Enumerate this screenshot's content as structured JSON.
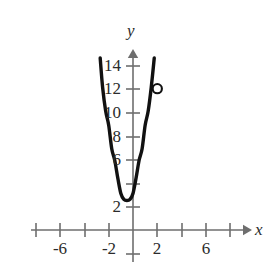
{
  "chart_data": {
    "type": "line",
    "title": "",
    "subtitle": "",
    "xlabel": "x",
    "ylabel": "y",
    "grid": false,
    "legend": null,
    "xlim": [
      -9.5,
      9.5
    ],
    "ylim": [
      -1.5,
      15.6
    ],
    "x_ticks": [
      -8,
      -6,
      -4,
      -2,
      2,
      4,
      6,
      8
    ],
    "x_tick_labels": [
      "",
      "-6",
      "",
      "-2",
      "2",
      "",
      "6",
      ""
    ],
    "y_ticks": [
      2,
      4,
      6,
      8,
      10,
      12,
      14
    ],
    "y_tick_labels": [
      "2",
      "",
      "6",
      "8",
      "10",
      "12",
      "14"
    ],
    "series": [
      {
        "name": "parabola",
        "type": "quadratic",
        "equation": "y = 2.4(x + 0.5)^2 + 2.5",
        "vertex": [
          -0.5,
          2.5
        ],
        "color": "#111111",
        "x_range": [
          -2.7,
          1.75
        ],
        "points": [
          [
            -2.7,
            14.6
          ],
          [
            -2.5,
            12.1
          ],
          [
            -2.25,
            10.1
          ],
          [
            -2.0,
            8.9
          ],
          [
            -1.75,
            6.9
          ],
          [
            -1.5,
            5.9
          ],
          [
            -1.25,
            4.4
          ],
          [
            -1.0,
            3.1
          ],
          [
            -0.75,
            2.6
          ],
          [
            -0.5,
            2.5
          ],
          [
            -0.25,
            2.6
          ],
          [
            0.0,
            3.1
          ],
          [
            0.25,
            4.4
          ],
          [
            0.5,
            5.9
          ],
          [
            0.75,
            6.9
          ],
          [
            1.0,
            8.9
          ],
          [
            1.25,
            10.1
          ],
          [
            1.5,
            12.1
          ],
          [
            1.75,
            14.6
          ]
        ]
      }
    ],
    "markers": [
      {
        "name": "open-circle-point",
        "x": 2,
        "y": 12,
        "style": "open",
        "fill": "#ffffff",
        "stroke": "#111111",
        "label": ""
      }
    ],
    "axes": {
      "x_axis_arrow": true,
      "y_axis_arrow": true,
      "axis_color": "#6e6e6e",
      "origin_label": ""
    }
  },
  "labels": {
    "y_axis_name": "y",
    "x_axis_name": "x",
    "y_14": "14",
    "y_12": "12",
    "y_10": "10",
    "y_8": "8",
    "y_6": "6",
    "y_2": "2",
    "x_neg6": "-6",
    "x_neg2": "-2",
    "x_pos2": "2",
    "x_pos6": "6"
  }
}
